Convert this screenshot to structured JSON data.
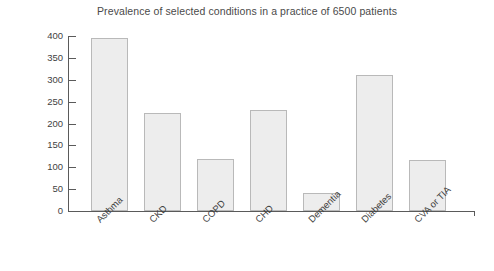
{
  "chart_data": {
    "type": "bar",
    "title": "Prevalence of selected conditions in a practice of 6500 patients",
    "xlabel": "",
    "ylabel": "Number of patients",
    "categories": [
      "Asthma",
      "CKD",
      "COPD",
      "CHD",
      "Dementia",
      "Diabetes",
      "CVA or TIA"
    ],
    "values": [
      395,
      225,
      120,
      232,
      42,
      312,
      117
    ],
    "ylim": [
      0,
      400
    ],
    "yticks": [
      0,
      50,
      100,
      150,
      200,
      250,
      300,
      350,
      400
    ],
    "ytick_labels": [
      "0",
      "50",
      "100",
      "150",
      "200",
      "250",
      "300",
      "350",
      "400"
    ],
    "grid": false,
    "legend": null,
    "bar_color": "#ededed",
    "bar_border_color": "#b9b9b9",
    "axis_color": "#5a5a5a",
    "text_color": "#3f3f3f"
  }
}
